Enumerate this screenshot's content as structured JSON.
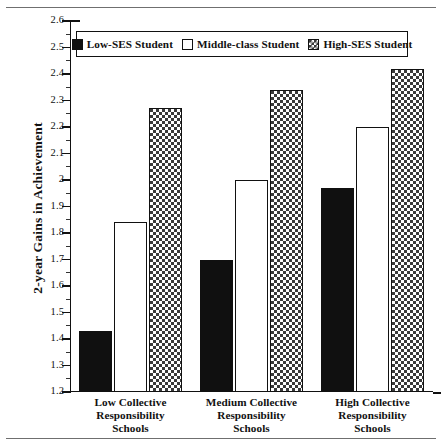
{
  "figure": {
    "yaxis_title": "2-year Gains in Achievement"
  },
  "legend": {
    "items": [
      {
        "label": "Low-SES Student",
        "swatch": "black-solid-square-icon",
        "key": "low"
      },
      {
        "label": "Middle-class Student",
        "swatch": "white-outline-square-icon",
        "key": "mid"
      },
      {
        "label": "High-SES Student",
        "swatch": "checkered-square-icon",
        "key": "high"
      }
    ]
  },
  "chart_data": {
    "type": "bar",
    "title": "",
    "xlabel": "",
    "ylabel": "2-year Gains in Achievement",
    "ylim": [
      1.2,
      2.6
    ],
    "ytick_step": 0.1,
    "yticks": [
      "1.2",
      "1.3",
      "1.4",
      "1.5",
      "1.6",
      "1.7",
      "1.8",
      "1.9",
      "2",
      "2.1",
      "2.2",
      "2.3",
      "2.4",
      "2.5",
      "2.6"
    ],
    "grid": false,
    "legend_position": "top-center-inside",
    "categories": [
      "Low Collective Responsibility Schools",
      "Medium Collective Responsibility Schools",
      "High Collective Responsibility Schools"
    ],
    "category_lines": [
      [
        "Low Collective",
        "Responsibility",
        "Schools"
      ],
      [
        "Medium Collective",
        "Responsibility",
        "Schools"
      ],
      [
        "High Collective",
        "Responsibility",
        "Schools"
      ]
    ],
    "series": [
      {
        "name": "Low-SES Student",
        "key": "low",
        "values": [
          1.43,
          1.7,
          1.97
        ]
      },
      {
        "name": "Middle-class Student",
        "key": "mid",
        "values": [
          1.84,
          2.0,
          2.2
        ]
      },
      {
        "name": "High-SES Student",
        "key": "high",
        "values": [
          2.27,
          2.34,
          2.42
        ]
      }
    ]
  }
}
